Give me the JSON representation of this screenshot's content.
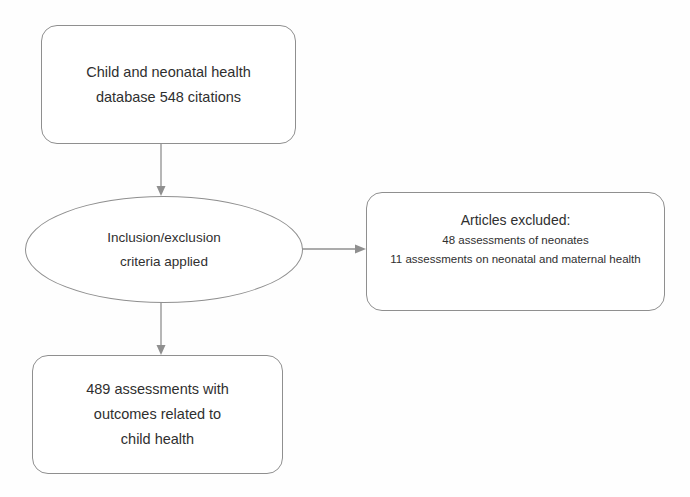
{
  "diagram": {
    "type": "flowchart",
    "background_color": "#fefefe",
    "stroke_color": "#8f8f8f",
    "text_color": "#2f2f2f",
    "nodes": [
      {
        "id": "source",
        "shape": "rounded-rectangle",
        "lines": [
          "Child and neonatal health",
          "database 548 citations"
        ]
      },
      {
        "id": "criteria",
        "shape": "ellipse",
        "lines": [
          "Inclusion/exclusion",
          "criteria applied"
        ]
      },
      {
        "id": "excluded",
        "shape": "rounded-rectangle",
        "heading": "Articles excluded:",
        "lines": [
          "48 assessments of neonates",
          "11 assessments on neonatal and maternal health"
        ]
      },
      {
        "id": "included",
        "shape": "rounded-rectangle",
        "lines": [
          "489 assessments with",
          "outcomes related to",
          "child health"
        ]
      }
    ],
    "connectors": [
      {
        "id": "source-to-criteria",
        "from": "source",
        "to": "criteria",
        "direction": "down",
        "arrowhead": true
      },
      {
        "id": "criteria-to-excluded",
        "from": "criteria",
        "to": "excluded",
        "direction": "right",
        "arrowhead": true
      },
      {
        "id": "criteria-to-included",
        "from": "criteria",
        "to": "included",
        "direction": "down",
        "arrowhead": true
      }
    ]
  }
}
